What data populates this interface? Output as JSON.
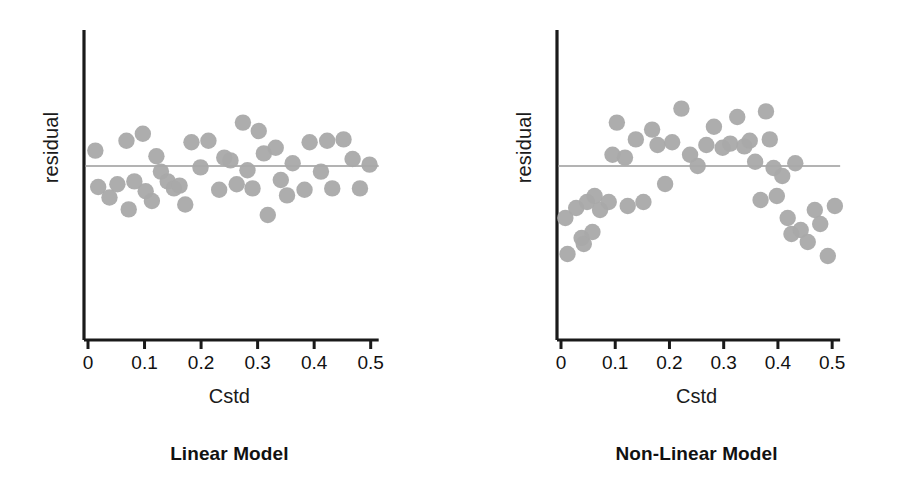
{
  "figure": {
    "background": "#ffffff",
    "point_color": "#a9a9a9",
    "axis_color": "#1a1a1a",
    "reference_line_color": "#9a9a9a"
  },
  "chart_data": [
    {
      "type": "scatter",
      "id": "linear-model-residuals",
      "title": "Linear Model",
      "xlabel": "Cstd",
      "ylabel": "residual",
      "xlim": [
        0,
        0.52
      ],
      "ylim": [
        -1.0,
        1.0
      ],
      "xticks": [
        0,
        0.1,
        0.2,
        0.3,
        0.4,
        0.5
      ],
      "xticklabels": [
        "0",
        "0.1",
        "0.2",
        "0.3",
        "0.4",
        "0.5"
      ],
      "yticks": [],
      "yticklabels": [],
      "grid": false,
      "legend": null,
      "annotations": [],
      "reference_line": {
        "orientation": "horizontal",
        "y": 0.0
      },
      "x": [
        0.013,
        0.018,
        0.038,
        0.052,
        0.068,
        0.072,
        0.082,
        0.097,
        0.102,
        0.113,
        0.121,
        0.129,
        0.141,
        0.152,
        0.162,
        0.172,
        0.183,
        0.199,
        0.213,
        0.232,
        0.241,
        0.252,
        0.263,
        0.274,
        0.282,
        0.291,
        0.302,
        0.311,
        0.318,
        0.332,
        0.341,
        0.352,
        0.362,
        0.383,
        0.392,
        0.412,
        0.423,
        0.432,
        0.452,
        0.468,
        0.481,
        0.498
      ],
      "y": [
        0.22,
        -0.3,
        -0.45,
        -0.26,
        0.36,
        -0.62,
        -0.22,
        0.46,
        -0.36,
        -0.5,
        0.14,
        -0.08,
        -0.22,
        -0.32,
        -0.28,
        -0.55,
        0.34,
        -0.02,
        0.36,
        -0.34,
        0.12,
        0.08,
        -0.26,
        0.62,
        -0.06,
        -0.32,
        0.5,
        0.18,
        -0.7,
        0.26,
        -0.2,
        -0.42,
        0.04,
        -0.34,
        0.34,
        -0.08,
        0.36,
        -0.32,
        0.38,
        0.1,
        -0.32,
        0.02
      ]
    },
    {
      "type": "scatter",
      "id": "non-linear-model-residuals",
      "title": "Non-Linear Model",
      "xlabel": "Cstd",
      "ylabel": "residual",
      "xlim": [
        0,
        0.52
      ],
      "ylim": [
        -1.0,
        1.0
      ],
      "xticks": [
        0,
        0.1,
        0.2,
        0.3,
        0.4,
        0.5
      ],
      "xticklabels": [
        "0",
        "0.1",
        "0.2",
        "0.3",
        "0.4",
        "0.5"
      ],
      "yticks": [],
      "yticklabels": [],
      "grid": false,
      "legend": null,
      "annotations": [],
      "reference_line": {
        "orientation": "horizontal",
        "y": 0.0
      },
      "x": [
        0.008,
        0.012,
        0.028,
        0.038,
        0.042,
        0.048,
        0.058,
        0.062,
        0.072,
        0.088,
        0.095,
        0.103,
        0.118,
        0.123,
        0.138,
        0.152,
        0.168,
        0.178,
        0.192,
        0.205,
        0.222,
        0.238,
        0.252,
        0.268,
        0.282,
        0.298,
        0.312,
        0.325,
        0.338,
        0.348,
        0.358,
        0.368,
        0.378,
        0.385,
        0.392,
        0.398,
        0.408,
        0.418,
        0.425,
        0.432,
        0.442,
        0.455,
        0.468,
        0.478,
        0.492,
        0.505
      ],
      "y": [
        -0.52,
        -0.88,
        -0.42,
        -0.72,
        -0.78,
        -0.36,
        -0.66,
        -0.3,
        -0.44,
        -0.36,
        0.16,
        0.62,
        0.12,
        -0.4,
        0.38,
        -0.36,
        0.52,
        0.3,
        -0.18,
        0.34,
        0.82,
        0.16,
        0.0,
        0.3,
        0.56,
        0.26,
        0.32,
        0.7,
        0.28,
        0.36,
        0.06,
        -0.34,
        0.78,
        0.38,
        -0.02,
        -0.3,
        -0.1,
        -0.52,
        -0.68,
        0.04,
        -0.64,
        -0.76,
        -0.44,
        -0.58,
        -0.9,
        -0.4
      ]
    }
  ],
  "panels": {
    "left": {
      "caption": "Linear Model",
      "y_axis_label": "residual",
      "x_axis_label": "Cstd",
      "tick_labels": [
        "0",
        "0.1",
        "0.2",
        "0.3",
        "0.4",
        "0.5"
      ]
    },
    "right": {
      "caption": "Non-Linear Model",
      "y_axis_label": "residual",
      "x_axis_label": "Cstd",
      "tick_labels": [
        "0",
        "0.1",
        "0.2",
        "0.3",
        "0.4",
        "0.5"
      ]
    }
  }
}
